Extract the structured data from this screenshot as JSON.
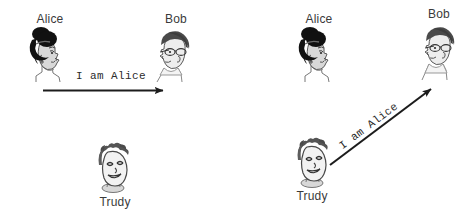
{
  "diagram": {
    "title_present": false,
    "background_color": "#ffffff",
    "ink_color": "#2b2b2b",
    "panels": [
      {
        "id": "legitimate-authentication",
        "name": "left-panel",
        "actors": [
          {
            "id": "alice",
            "label": "Alice",
            "icon": "alice-head-icon",
            "hair_color": "#111111",
            "skin_color": "#d8d8d8",
            "facing": "right"
          },
          {
            "id": "bob",
            "label": "Bob",
            "icon": "bob-head-icon",
            "hair_color": "#4a4a4a",
            "skin_color": "#ededed",
            "facing": "left",
            "accessory": "glasses"
          },
          {
            "id": "trudy",
            "label": "Trudy",
            "icon": "trudy-head-icon",
            "hair_color": "#555555",
            "skin_color": "#f2f2f2",
            "facing": "right",
            "expression": "smirk"
          }
        ],
        "messages": [
          {
            "id": "alice-to-bob",
            "text": "I am Alice",
            "from": "alice",
            "to": "bob",
            "direction": "horizontal-right",
            "color": "#1c1c1c"
          }
        ]
      },
      {
        "id": "impersonation-attack",
        "name": "right-panel",
        "actors": [
          {
            "id": "alice",
            "label": "Alice",
            "icon": "alice-head-icon",
            "hair_color": "#111111",
            "skin_color": "#d8d8d8",
            "facing": "right"
          },
          {
            "id": "bob",
            "label": "Bob",
            "icon": "bob-head-icon",
            "hair_color": "#4a4a4a",
            "skin_color": "#ededed",
            "facing": "left",
            "accessory": "glasses"
          },
          {
            "id": "trudy",
            "label": "Trudy",
            "icon": "trudy-head-icon",
            "hair_color": "#555555",
            "skin_color": "#f2f2f2",
            "facing": "right",
            "expression": "smirk"
          }
        ],
        "messages": [
          {
            "id": "trudy-to-bob",
            "text": "I am Alice",
            "from": "trudy",
            "to": "bob",
            "direction": "diagonal-up-right",
            "angle_degrees": -36.8,
            "color": "#1c1c1c"
          }
        ]
      }
    ]
  }
}
